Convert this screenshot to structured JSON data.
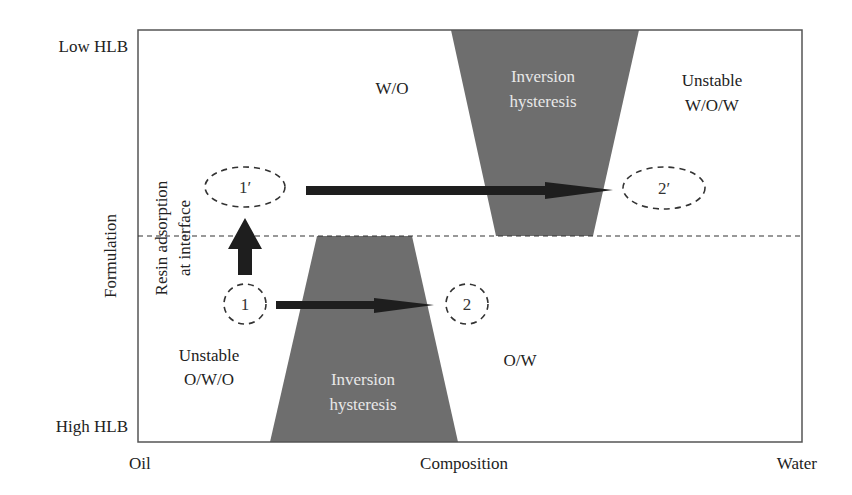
{
  "diagram": {
    "y_axis": {
      "label": "Formulation",
      "top_label": "Low HLB",
      "bottom_label": "High HLB"
    },
    "x_axis": {
      "label": "Composition",
      "left_label": "Oil",
      "right_label": "Water"
    },
    "regions": {
      "upper_left": "W/O",
      "upper_right_line1": "Unstable",
      "upper_right_line2": "W/O/W",
      "lower_left_line1": "Unstable",
      "lower_left_line2": "O/W/O",
      "lower_right": "O/W"
    },
    "hysteresis_upper": {
      "line1": "Inversion",
      "line2": "hysteresis"
    },
    "hysteresis_lower": {
      "line1": "Inversion",
      "line2": "hysteresis"
    },
    "annotation": {
      "line1": "Resin adsorption",
      "line2": "at interface"
    },
    "points": {
      "p1": "1",
      "p2": "2",
      "p1_prime": "1′",
      "p2_prime": "2′"
    },
    "colors": {
      "hysteresis_fill": "#6e6e6e",
      "arrow": "#1e1e1e",
      "frame": "#555555",
      "text": "#222222"
    }
  }
}
